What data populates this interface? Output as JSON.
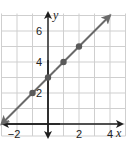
{
  "chart_data": {
    "type": "line",
    "title": "",
    "xlabel": "x",
    "ylabel": "y",
    "xlim": [
      -3,
      5
    ],
    "ylim": [
      0,
      7
    ],
    "grid": true,
    "x_tick_labels": [
      {
        "value": -2,
        "label": "−2"
      },
      {
        "value": 2,
        "label": "2"
      },
      {
        "value": 4,
        "label": "4"
      }
    ],
    "y_tick_labels": [
      {
        "value": 2,
        "label": "2"
      },
      {
        "value": 4,
        "label": "4"
      },
      {
        "value": 6,
        "label": "6"
      }
    ],
    "series": [
      {
        "name": "y = x + 3",
        "line": {
          "from": [
            -3,
            0
          ],
          "to": [
            4,
            7
          ],
          "arrows": "both"
        },
        "points": [
          {
            "x": -1,
            "y": 2
          },
          {
            "x": 0,
            "y": 3
          },
          {
            "x": 1,
            "y": 4
          },
          {
            "x": 2,
            "y": 5
          }
        ]
      }
    ],
    "colors": {
      "line": "#6a6a6a",
      "points": "#5a5a5a",
      "grid": "#cfcfcf",
      "axes": "#1e1e1e"
    }
  }
}
